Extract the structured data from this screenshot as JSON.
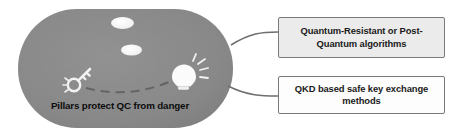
{
  "diagram": {
    "title_visible": false,
    "colors": {
      "ellipse_fill": "#8d8d8d",
      "ellipse_fill_dark": "#7f7f7f",
      "box_border": "#7a7a7a",
      "box1_fill": "#ebebeb",
      "box2_fill": "#fdfdfd",
      "connector": "#6e6e6e",
      "text": "#111111",
      "blob_fill": "#f7f7f7"
    },
    "central_shape": {
      "name": "rounded-ellipse",
      "caption": "Pillars protect QC from danger",
      "icons": [
        {
          "name": "key-icon",
          "label": "key"
        },
        {
          "name": "lightbulb-icon",
          "label": "lightbulb"
        },
        {
          "name": "blob-upper-icon",
          "label": "blob"
        },
        {
          "name": "blob-lower-icon",
          "label": "blob"
        },
        {
          "name": "dashed-arc-icon",
          "label": "dashed path"
        }
      ]
    },
    "callouts": [
      {
        "id": "pqc",
        "line1": "Quantum-Resistant or Post-",
        "line2": "Quantum algorithms",
        "text": "Quantum-Resistant or Post-Quantum algorithms"
      },
      {
        "id": "qkd",
        "line1": "QKD based safe key exchange",
        "line2": "methods",
        "text": "QKD based safe key exchange methods"
      }
    ]
  }
}
